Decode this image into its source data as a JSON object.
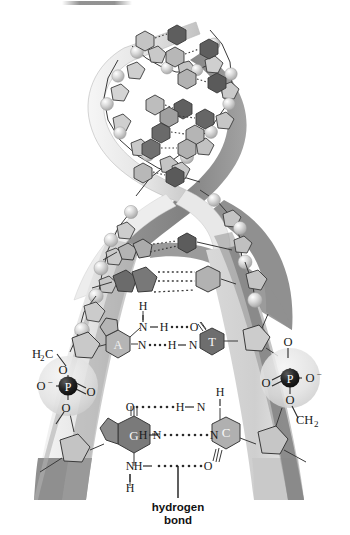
{
  "figure": {
    "top_smudge": true
  },
  "colors": {
    "background": "#ffffff",
    "ribbon_left_top": "#e9e9e9",
    "ribbon_left_bottom": "#8f8f8f",
    "ribbon_right_light": "#dcdcdc",
    "ribbon_right_dark": "#7d7d7d",
    "sugar_fill": "#bdbdbd",
    "sugar_fill_light": "#d2d2d2",
    "sphere_light": "#efefef",
    "sphere_mid": "#c9c9c9",
    "base_adenine": "#b5b5b5",
    "base_thymine": "#6e6e6e",
    "base_guanine": "#7a7a7a",
    "base_cytosine": "#b0b0b0",
    "base_dark": "#5e5e5e",
    "base_mid": "#9a9a9a",
    "phosphorus": "#1c1c1c",
    "halo": "#e2e2e2",
    "stroke": "#2b2b2b",
    "hbond_dot": "#2b2b2b",
    "text": "#1a1a1a"
  },
  "annotations": {
    "hydrogen_bond_label_line1": "hydrogen",
    "hydrogen_bond_label_line2": "bond"
  },
  "base_pairs": [
    {
      "id": "at-pair",
      "left_base": "A",
      "left_base_name": "adenine",
      "right_base": "T",
      "right_base_name": "thymine",
      "hydrogen_bond_count": 2,
      "bonds": [
        {
          "left_atom": "N",
          "bridge": "H",
          "right_atom": "O",
          "dots": 4,
          "left_link": "—",
          "right_link": ""
        },
        {
          "left_atom": "N",
          "bridge": "H",
          "right_atom": "N",
          "dots": 4,
          "left_link": "",
          "right_link": "—"
        }
      ],
      "amine_h": "H"
    },
    {
      "id": "gc-pair",
      "left_base": "G",
      "left_base_name": "guanine",
      "right_base": "C",
      "right_base_name": "cytosine",
      "hydrogen_bond_count": 3,
      "bonds": [
        {
          "left_atom": "O",
          "bridge": "H",
          "right_atom": "N",
          "dots": 7,
          "left_link": "",
          "right_link": "—"
        },
        {
          "left_atom": "N",
          "bridge": "H",
          "right_atom": "N",
          "dots": 8,
          "left_link": "—",
          "right_link": ""
        },
        {
          "left_atom": "N",
          "bridge": "H",
          "right_atom": "O",
          "dots": 8,
          "left_link": "—",
          "right_link": ""
        }
      ],
      "amine_h_top": "H",
      "amine_h_bottom": "H"
    }
  ],
  "phosphate_left": {
    "name": "phosphate-group-left",
    "ch2_label": "H₂C",
    "ch2_main": "H",
    "ch2_sub": "2",
    "ch2_tail": "C",
    "o_top": "O",
    "o_minus": "O",
    "minus_sign": "−",
    "o_double": "O",
    "o_bottom": "O",
    "p": "P"
  },
  "phosphate_right": {
    "name": "phosphate-group-right",
    "o_top": "O",
    "o_minus": "O",
    "minus_sign": "−",
    "o_double": "O",
    "o_bottom": "O",
    "p": "P",
    "ch2_main": "C",
    "ch2_sub": "2",
    "ch2_label": "CH₂"
  },
  "helix": {
    "description": "antiparallel double helix unwinding into two splayed strands",
    "turns": 3,
    "strand_left_name": "sugar-phosphate-backbone-left",
    "strand_right_name": "sugar-phosphate-backbone-right"
  }
}
